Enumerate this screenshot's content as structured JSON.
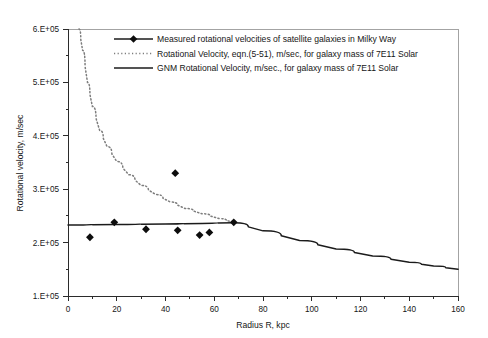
{
  "chart_data": {
    "type": "scatter",
    "title": "",
    "xlabel": "Radius R, kpc",
    "ylabel": "Rotational velocity, m/sec",
    "xlim": [
      0,
      160
    ],
    "ylim": [
      100000,
      600000
    ],
    "xticks": [
      "0",
      "20",
      "40",
      "60",
      "80",
      "100",
      "120",
      "140",
      "160"
    ],
    "xtick_values": [
      0,
      20,
      40,
      60,
      80,
      100,
      120,
      140,
      160
    ],
    "yticks": [
      "1.E+05",
      "2.E+05",
      "3.E+05",
      "4.E+05",
      "5.E+05",
      "6.E+05"
    ],
    "ytick_values": [
      100000,
      200000,
      300000,
      400000,
      500000,
      600000
    ],
    "grid": false,
    "legend_position": "top-center",
    "series": [
      {
        "name": "Measured rotational velocities of satellite galaxies in Milky Way",
        "type": "scatter",
        "marker": "diamond",
        "color": "#0d0d0d",
        "points": [
          {
            "x": 9,
            "y": 210000
          },
          {
            "x": 19,
            "y": 238000
          },
          {
            "x": 32,
            "y": 225000
          },
          {
            "x": 44,
            "y": 330000
          },
          {
            "x": 45,
            "y": 223000
          },
          {
            "x": 54,
            "y": 214000
          },
          {
            "x": 58,
            "y": 219000
          },
          {
            "x": 68,
            "y": 238000
          }
        ]
      },
      {
        "name": "Rotational Velocity, eqn.(5-51), m/sec, for galaxy mass of 7E11 Solar",
        "type": "line",
        "style": "dotted",
        "color": "#7d7d7d",
        "points": [
          {
            "x": 4.5,
            "y": 600000
          },
          {
            "x": 6,
            "y": 560000
          },
          {
            "x": 8,
            "y": 500000
          },
          {
            "x": 10,
            "y": 455000
          },
          {
            "x": 13,
            "y": 410000
          },
          {
            "x": 16,
            "y": 380000
          },
          {
            "x": 20,
            "y": 352000
          },
          {
            "x": 25,
            "y": 327000
          },
          {
            "x": 30,
            "y": 307000
          },
          {
            "x": 36,
            "y": 290000
          },
          {
            "x": 42,
            "y": 276000
          },
          {
            "x": 48,
            "y": 264000
          },
          {
            "x": 55,
            "y": 254000
          },
          {
            "x": 62,
            "y": 245000
          },
          {
            "x": 68,
            "y": 238000
          }
        ]
      },
      {
        "name": "GNM Rotational Velocity, m/sec., for galaxy mass of 7E11 Solar",
        "type": "line",
        "style": "solid",
        "color": "#1b1b1b",
        "points": [
          {
            "x": 0,
            "y": 233000
          },
          {
            "x": 20,
            "y": 234000
          },
          {
            "x": 40,
            "y": 235000
          },
          {
            "x": 55,
            "y": 236000
          },
          {
            "x": 68,
            "y": 237000
          },
          {
            "x": 80,
            "y": 222000
          },
          {
            "x": 95,
            "y": 204000
          },
          {
            "x": 110,
            "y": 188000
          },
          {
            "x": 125,
            "y": 175000
          },
          {
            "x": 140,
            "y": 163000
          },
          {
            "x": 150,
            "y": 156000
          },
          {
            "x": 160,
            "y": 150000
          }
        ]
      }
    ]
  },
  "legend": {
    "entries": [
      {
        "label": "Measured rotational velocities of satellite galaxies in Milky Way",
        "marker": "diamond-with-line"
      },
      {
        "label": "Rotational Velocity, eqn.(5-51), m/sec, for galaxy mass of 7E11 Solar",
        "marker": "dotted-line"
      },
      {
        "label": "GNM Rotational Velocity, m/sec., for galaxy mass of 7E11 Solar",
        "marker": "solid-line"
      }
    ]
  },
  "axes": {
    "x_title": "Radius R, kpc",
    "y_title": "Rotational velocity, m/sec",
    "x_tick_labels": [
      "0",
      "20",
      "40",
      "60",
      "80",
      "100",
      "120",
      "140",
      "160"
    ],
    "y_tick_labels": [
      "1.E+05",
      "2.E+05",
      "3.E+05",
      "4.E+05",
      "5.E+05",
      "6.E+05"
    ]
  },
  "colors": {
    "measured": "#0d0d0d",
    "equation": "#7d7d7d",
    "gnm": "#1b1b1b",
    "axis": "#2b2b2b",
    "frame": "#8c8c8c",
    "background": "#ffffff"
  }
}
